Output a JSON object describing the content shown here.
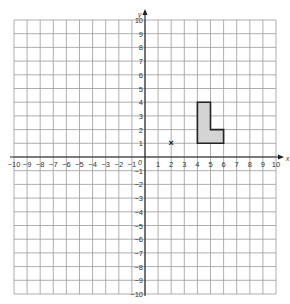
{
  "diagram": {
    "type": "coordinate-grid",
    "x_axis": {
      "label": "x",
      "min": -10,
      "max": 10,
      "ticks": [
        -10,
        -9,
        -8,
        -7,
        -6,
        -5,
        -4,
        -3,
        -2,
        -1,
        1,
        2,
        3,
        4,
        5,
        6,
        7,
        8,
        9,
        10
      ]
    },
    "y_axis": {
      "label": "y",
      "min": -10,
      "max": 10,
      "ticks": [
        10,
        9,
        8,
        7,
        6,
        5,
        4,
        3,
        2,
        1,
        -1,
        -2,
        -3,
        -4,
        -5,
        -6,
        -7,
        -8,
        -9,
        -10
      ]
    },
    "origin_label": "0",
    "shape": {
      "name": "L-shape",
      "vertices": [
        [
          4,
          1
        ],
        [
          4,
          4
        ],
        [
          5,
          4
        ],
        [
          5,
          2
        ],
        [
          6,
          2
        ],
        [
          6,
          1
        ]
      ],
      "fill": "#d4d4d4",
      "stroke": "#222222"
    },
    "point": {
      "label": "×",
      "x": 2,
      "y": 1
    },
    "colors": {
      "grid": "#9a9a9a",
      "axis": "#222222",
      "text": "#333333"
    }
  }
}
